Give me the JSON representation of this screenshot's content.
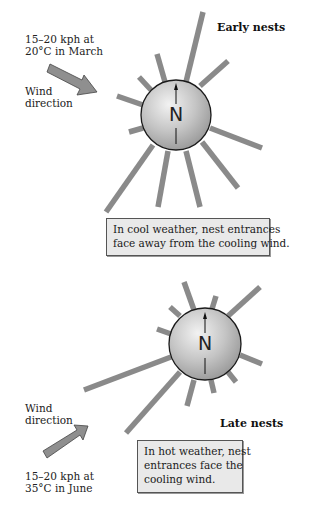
{
  "top_panel": {
    "title": "Early nests",
    "wind_speed_line1": "15–20 kph at",
    "wind_speed_line2": "20°C in March",
    "wind_label_line1": "Wind",
    "wind_label_line2": "direction",
    "arrow_icon": "wind-arrow-down-right",
    "compass_letter": "N",
    "note_line1": "In cool weather, nest entrances",
    "note_line2": "face away from the cooling wind."
  },
  "bottom_panel": {
    "title": "Late nests",
    "wind_speed_line1": "15–20 kph at",
    "wind_speed_line2": "35°C in June",
    "wind_label_line1": "Wind",
    "wind_label_line2": "direction",
    "arrow_icon": "wind-arrow-up-right",
    "compass_letter": "N",
    "note_line1": "In hot weather, nest",
    "note_line2": "entrances face the",
    "note_line3": "cooling wind."
  },
  "colors": {
    "ray": "#8a8a8a",
    "sphere_light": "#e6e6e6",
    "sphere_dark": "#9a9a9a",
    "arrow_fill": "#8f8f8f",
    "box_fill": "#e9e9e9"
  }
}
